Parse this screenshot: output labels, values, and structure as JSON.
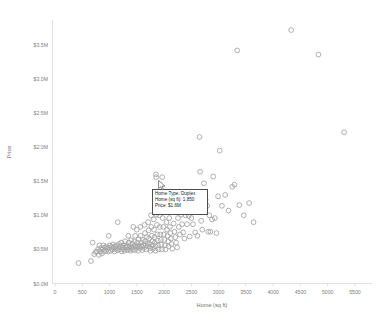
{
  "chart_data": {
    "type": "scatter",
    "title": "",
    "xlabel": "Home (sq ft)",
    "ylabel": "Price",
    "xlim": [
      0,
      5500
    ],
    "ylim": [
      0,
      3750000
    ],
    "grid": false,
    "legend": null,
    "xticks": [
      0,
      500,
      1000,
      1500,
      2000,
      2500,
      3000,
      3500,
      4000,
      4500,
      5000,
      5500
    ],
    "xticklabels": [
      "0",
      "500",
      "1000",
      "1500",
      "2000",
      "2500",
      "3000",
      "3500",
      "4000",
      "4500",
      "5000",
      "5500"
    ],
    "yticks": [
      0,
      500000,
      1000000,
      1500000,
      2000000,
      2500000,
      3000000,
      3500000
    ],
    "yticklabels": [
      "$0.0M",
      "$0.5M",
      "$1.0M",
      "$1.5M",
      "$2.0M",
      "$2.5M",
      "$3.0M",
      "$3.5M"
    ],
    "marker": {
      "shape": "circle-open",
      "stroke_color": "#a6a6a6",
      "radius_px": 2.4
    },
    "series": [
      {
        "name": "Homes",
        "points": [
          [
            430,
            300000
          ],
          [
            660,
            330000
          ],
          [
            690,
            600000
          ],
          [
            720,
            430000
          ],
          [
            745,
            460000
          ],
          [
            770,
            470000
          ],
          [
            790,
            505000
          ],
          [
            805,
            420000
          ],
          [
            815,
            560000
          ],
          [
            830,
            470000
          ],
          [
            845,
            520000
          ],
          [
            860,
            440000
          ],
          [
            875,
            500000
          ],
          [
            885,
            560000
          ],
          [
            900,
            470000
          ],
          [
            915,
            530000
          ],
          [
            930,
            480000
          ],
          [
            945,
            545000
          ],
          [
            960,
            510000
          ],
          [
            975,
            470000
          ],
          [
            985,
            700000
          ],
          [
            995,
            520000
          ],
          [
            1005,
            560000
          ],
          [
            1020,
            480000
          ],
          [
            1035,
            540000
          ],
          [
            1050,
            500000
          ],
          [
            1065,
            575000
          ],
          [
            1075,
            520000
          ],
          [
            1090,
            470000
          ],
          [
            1100,
            545000
          ],
          [
            1115,
            505000
          ],
          [
            1130,
            560000
          ],
          [
            1145,
            490000
          ],
          [
            1150,
            900000
          ],
          [
            1160,
            530000
          ],
          [
            1175,
            580000
          ],
          [
            1185,
            500000
          ],
          [
            1200,
            545000
          ],
          [
            1215,
            600000
          ],
          [
            1225,
            470000
          ],
          [
            1235,
            530000
          ],
          [
            1250,
            505000
          ],
          [
            1260,
            560000
          ],
          [
            1275,
            480000
          ],
          [
            1285,
            620000
          ],
          [
            1300,
            525000
          ],
          [
            1310,
            560000
          ],
          [
            1325,
            490000
          ],
          [
            1335,
            545000
          ],
          [
            1345,
            700000
          ],
          [
            1350,
            600000
          ],
          [
            1360,
            505000
          ],
          [
            1375,
            545000
          ],
          [
            1385,
            480000
          ],
          [
            1395,
            635000
          ],
          [
            1405,
            525000
          ],
          [
            1415,
            580000
          ],
          [
            1425,
            500000
          ],
          [
            1435,
            830000
          ],
          [
            1445,
            545000
          ],
          [
            1455,
            620000
          ],
          [
            1465,
            490000
          ],
          [
            1470,
            700000
          ],
          [
            1480,
            560000
          ],
          [
            1490,
            525000
          ],
          [
            1500,
            790000
          ],
          [
            1505,
            600000
          ],
          [
            1515,
            540000
          ],
          [
            1525,
            480000
          ],
          [
            1535,
            650000
          ],
          [
            1545,
            560000
          ],
          [
            1555,
            520000
          ],
          [
            1565,
            830000
          ],
          [
            1570,
            700000
          ],
          [
            1580,
            600000
          ],
          [
            1590,
            545000
          ],
          [
            1600,
            490000
          ],
          [
            1610,
            640000
          ],
          [
            1620,
            560000
          ],
          [
            1630,
            520000
          ],
          [
            1640,
            860000
          ],
          [
            1650,
            740000
          ],
          [
            1655,
            620000
          ],
          [
            1665,
            560000
          ],
          [
            1675,
            500000
          ],
          [
            1685,
            680000
          ],
          [
            1695,
            590000
          ],
          [
            1700,
            545000
          ],
          [
            1710,
            900000
          ],
          [
            1715,
            780000
          ],
          [
            1725,
            660000
          ],
          [
            1735,
            580000
          ],
          [
            1745,
            520000
          ],
          [
            1750,
            480000
          ],
          [
            1760,
            1000000
          ],
          [
            1765,
            830000
          ],
          [
            1775,
            700000
          ],
          [
            1785,
            620000
          ],
          [
            1790,
            560000
          ],
          [
            1800,
            510000
          ],
          [
            1810,
            940000
          ],
          [
            1815,
            790000
          ],
          [
            1825,
            680000
          ],
          [
            1830,
            600000
          ],
          [
            1840,
            545000
          ],
          [
            1845,
            480000
          ],
          [
            1850,
            1600000
          ],
          [
            1855,
            1560000
          ],
          [
            1860,
            1010000
          ],
          [
            1870,
            860000
          ],
          [
            1875,
            720000
          ],
          [
            1885,
            630000
          ],
          [
            1890,
            560000
          ],
          [
            1900,
            500000
          ],
          [
            1910,
            1000000
          ],
          [
            1920,
            830000
          ],
          [
            1930,
            720000
          ],
          [
            1940,
            640000
          ],
          [
            1950,
            570000
          ],
          [
            1960,
            500000
          ],
          [
            1965,
            1560000
          ],
          [
            1975,
            960000
          ],
          [
            1985,
            830000
          ],
          [
            1995,
            720000
          ],
          [
            2005,
            640000
          ],
          [
            2015,
            560000
          ],
          [
            2025,
            500000
          ],
          [
            2035,
            1050000
          ],
          [
            2045,
            900000
          ],
          [
            2055,
            790000
          ],
          [
            2065,
            700000
          ],
          [
            2075,
            620000
          ],
          [
            2085,
            545000
          ],
          [
            2095,
            960000
          ],
          [
            2105,
            830000
          ],
          [
            2115,
            740000
          ],
          [
            2125,
            660000
          ],
          [
            2135,
            580000
          ],
          [
            2150,
            510000
          ],
          [
            2165,
            1050000
          ],
          [
            2175,
            880000
          ],
          [
            2190,
            760000
          ],
          [
            2205,
            680000
          ],
          [
            2220,
            600000
          ],
          [
            2240,
            530000
          ],
          [
            2255,
            960000
          ],
          [
            2270,
            830000
          ],
          [
            2290,
            720000
          ],
          [
            2310,
            1010000
          ],
          [
            2330,
            870000
          ],
          [
            2350,
            750000
          ],
          [
            2375,
            660000
          ],
          [
            2395,
            1000000
          ],
          [
            2420,
            870000
          ],
          [
            2450,
            990000
          ],
          [
            2470,
            690000
          ],
          [
            2500,
            960000
          ],
          [
            2530,
            870000
          ],
          [
            2570,
            750000
          ],
          [
            2610,
            700000
          ],
          [
            2650,
            2150000
          ],
          [
            2660,
            1640000
          ],
          [
            2680,
            920000
          ],
          [
            2700,
            790000
          ],
          [
            2730,
            1470000
          ],
          [
            2760,
            1230000
          ],
          [
            2790,
            1140000
          ],
          [
            2810,
            760000
          ],
          [
            2830,
            1000000
          ],
          [
            2850,
            760000
          ],
          [
            2880,
            940000
          ],
          [
            2900,
            1570000
          ],
          [
            2930,
            960000
          ],
          [
            2960,
            740000
          ],
          [
            2990,
            1280000
          ],
          [
            3020,
            1950000
          ],
          [
            3060,
            1140000
          ],
          [
            3120,
            1300000
          ],
          [
            3180,
            1070000
          ],
          [
            3250,
            1420000
          ],
          [
            3290,
            1450000
          ],
          [
            3340,
            3420000
          ],
          [
            3380,
            1150000
          ],
          [
            3460,
            1000000
          ],
          [
            3560,
            1180000
          ],
          [
            3640,
            900000
          ],
          [
            4330,
            3720000
          ],
          [
            4830,
            3360000
          ],
          [
            5300,
            2220000
          ]
        ]
      }
    ]
  },
  "tooltip": {
    "lines": [
      "Home Type: Duplex",
      "Home (sq ft): 1,850",
      "Price: $1.6M"
    ],
    "home_type": "Duplex",
    "home_sqft": "1,850",
    "price": "$1.6M"
  },
  "cursor": {
    "name": "arrow-cursor",
    "visible": true
  }
}
